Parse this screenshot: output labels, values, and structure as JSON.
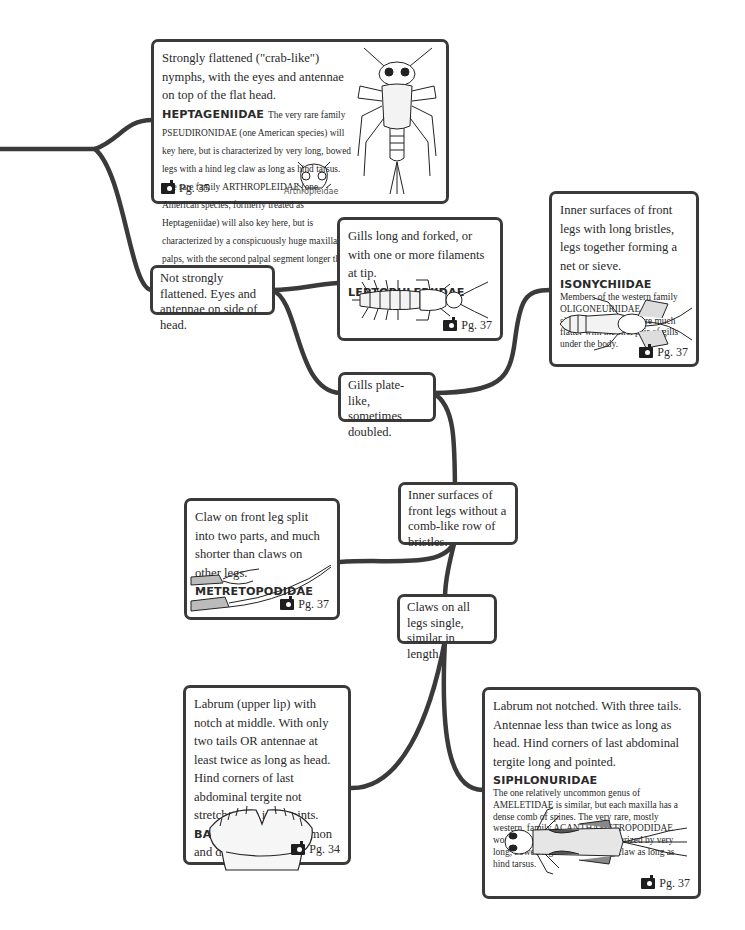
{
  "diagram": {
    "type": "dichotomous-identification-key",
    "nodes": {
      "heptageniidae": {
        "lead": "Strongly flattened (\"crab-like\") nymphs, with the eyes and antennae on top of the flat head.",
        "family": "HEPTAGENIIDAE",
        "note": "The very rare family PSEUDIRONIDAE (one American species) will key here, but is characterized by very long, bowed legs with a hind leg claw as long as hind tarsus. The rare family ARTHROPLEIDAE (one American species, formerly treated as Heptageniidae) will also key here, but is characterized by a conspicuously huge maxillary palps, with the second palpal segment longer than head width.",
        "caption": "Arthropleidae",
        "page": "Pg. 35",
        "illustration": "heptageniid-nymph-dorsal"
      },
      "not_flattened": {
        "lead": "Not strongly flattened. Eyes and antennae on side of head."
      },
      "leptophlebiidae": {
        "lead": "Gills long and forked, or with one or more filaments at tip.",
        "family": "LEPTOPHLEBIIDAE",
        "page": "Pg. 37",
        "illustration": "leptophlebiid-nymph"
      },
      "isonychiidae": {
        "lead": "Inner surfaces of front legs with long bristles, legs together forming a net or sieve.",
        "family": "ISONYCHIIDAE",
        "note": "Members of the western family OLIGONEURIIDAE, have similar front legs but are much flatter with the first pair of gills under the body.",
        "page": "Pg. 37",
        "illustration": "isonychiid-nymph"
      },
      "gills_plate": {
        "lead": "Gills plate-like, sometimes doubled."
      },
      "no_comb": {
        "lead": "Inner surfaces of front legs without a comb-like row of bristles."
      },
      "metretopodidae": {
        "lead": "Claw on front leg split into two parts, and much shorter than claws on other legs.",
        "family": "METRETOPODIDAE",
        "page": "Pg. 37",
        "illustration": "split-claw"
      },
      "claws_single": {
        "lead": "Claws on all legs single, similar in length."
      },
      "baetidae": {
        "lead": "Labrum (upper lip) with notch at middle. With only two tails OR antennae at least twice as long as head. Hind corners of last abdominal tergite not stretched out into points.",
        "family": "BAETIDAE",
        "tail": "Very common and diverse.",
        "page": "Pg. 34",
        "illustration": "notched-labrum"
      },
      "siphlonuridae": {
        "lead": "Labrum not notched. With three tails. Antennae less than twice as long as head. Hind corners of last abdominal tergite long and pointed.",
        "family": "SIPHLONURIDAE",
        "note": "The one relatively uncommon genus of AMELETIDAE is similar, but each maxilla  has a dense comb of spines. The very rare, mostly western, family ACANTHAMETROPODIDAE would key out here, but is characterized by very long, bowed legs with a hind leg claw as long as hind tarsus.",
        "page": "Pg. 37",
        "illustration": "siphlonurid-nymph"
      }
    },
    "edges": [
      [
        "root",
        "heptageniidae"
      ],
      [
        "root",
        "not_flattened"
      ],
      [
        "not_flattened",
        "leptophlebiidae"
      ],
      [
        "not_flattened",
        "gills_plate"
      ],
      [
        "gills_plate",
        "isonychiidae"
      ],
      [
        "gills_plate",
        "no_comb"
      ],
      [
        "no_comb",
        "metretopodidae"
      ],
      [
        "no_comb",
        "claws_single"
      ],
      [
        "claws_single",
        "baetidae"
      ],
      [
        "claws_single",
        "siphlonuridae"
      ]
    ],
    "colors": {
      "line": "#3a3a3a",
      "text": "#2a2a2a",
      "background": "#ffffff"
    }
  }
}
